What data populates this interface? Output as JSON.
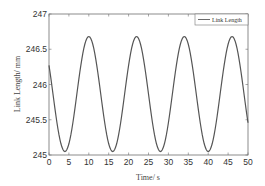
{
  "chart_data": {
    "type": "line",
    "title": "",
    "xlabel": "Time/ s",
    "ylabel": "Link Length/ mm",
    "xlim": [
      0,
      50
    ],
    "ylim": [
      245,
      247
    ],
    "xticks": [
      0,
      5,
      10,
      15,
      20,
      25,
      30,
      35,
      40,
      45,
      50
    ],
    "yticks": [
      245,
      245.5,
      246,
      246.5,
      247
    ],
    "xtick_labels": [
      "0",
      "5",
      "10",
      "15",
      "20",
      "25",
      "30",
      "35",
      "40",
      "45",
      "50"
    ],
    "ytick_labels": [
      "245",
      "245.5",
      "246",
      "246.5",
      "247"
    ],
    "grid": false,
    "legend": {
      "position": "upper right",
      "entries": [
        "Link Length"
      ]
    },
    "series": [
      {
        "name": "Link Length",
        "color": "#555555",
        "x": [
          0,
          2,
          4,
          6,
          8,
          10,
          12,
          14,
          16,
          18,
          20,
          22,
          24,
          26,
          28,
          30,
          32,
          34,
          36,
          38,
          40,
          42,
          44,
          46,
          48,
          50
        ],
        "values": [
          246.27,
          245.46,
          245.05,
          245.46,
          246.27,
          246.68,
          246.27,
          245.46,
          245.05,
          245.46,
          246.27,
          246.68,
          246.27,
          245.46,
          245.05,
          245.46,
          246.27,
          246.68,
          246.27,
          245.46,
          245.05,
          245.46,
          246.27,
          246.68,
          246.27,
          245.46
        ],
        "model": {
          "mean": 245.865,
          "amplitude": 0.815,
          "period": 12,
          "peak_t": 10
        }
      }
    ]
  }
}
